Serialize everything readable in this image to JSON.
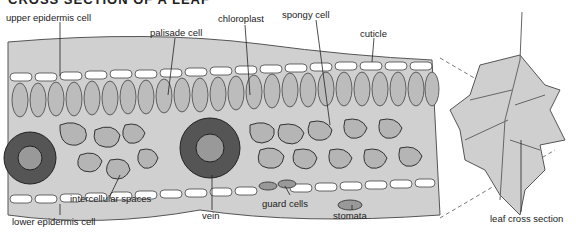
{
  "title": "CROSS SECTION OF A LEAF",
  "labels": {
    "upper_epidermis": "upper epidermis cell",
    "palisade": "palisade cell",
    "chloroplast": "chloroplast",
    "spongy": "spongy cell",
    "cuticle": "cuticle",
    "lower_epidermis": "lower epidermis cell",
    "intercellular": "intercellular spaces",
    "vein": "vein",
    "guard_cells": "guard cells",
    "stomata": "stomata",
    "leaf_cross_section": "leaf cross section"
  },
  "colors": {
    "tissue": "#c8c8c8",
    "cell": "#b8b8b8",
    "outline": "#444444",
    "leaf": "#cfcfcf"
  }
}
